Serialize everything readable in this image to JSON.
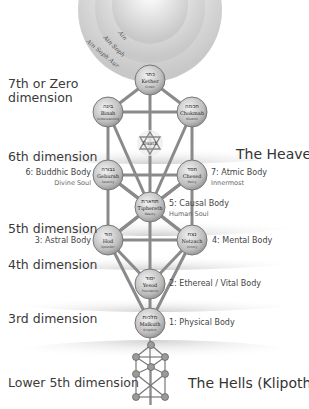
{
  "diagram": {
    "type": "tree-of-life",
    "ain_rings": [
      "Ain",
      "Ain Soph",
      "Ain Soph Aur"
    ],
    "dimensions": [
      {
        "label_line1": "7th or Zero",
        "label_line2": "dimension",
        "y": 126
      },
      {
        "label_line1": "6th dimension",
        "y": 157
      },
      {
        "label_line1": "5th dimension",
        "y": 229
      },
      {
        "label_line1": "4th dimension",
        "y": 265
      },
      {
        "label_line1": "3rd dimension",
        "y": 319
      },
      {
        "label_line1": "Lower 5th dimension",
        "y": 383
      }
    ],
    "regions": {
      "heavens": "The Heavens",
      "hells": "The Hells (Klipoth)"
    },
    "sephiroth": [
      {
        "id": "kether",
        "name": "Kether",
        "hebrew": "כתר",
        "sub": "Crown",
        "x": 150,
        "y": 80
      },
      {
        "id": "binah",
        "name": "Binah",
        "hebrew": "בינה",
        "sub": "Understanding",
        "x": 108,
        "y": 112
      },
      {
        "id": "chokmah",
        "name": "Chokmah",
        "hebrew": "חכמה",
        "sub": "Wisdom",
        "x": 192,
        "y": 112
      },
      {
        "id": "daath",
        "name": "Daath",
        "hebrew": "",
        "sub": "",
        "x": 150,
        "y": 143
      },
      {
        "id": "geburah",
        "name": "Geburah",
        "hebrew": "גבורה",
        "sub": "Severity",
        "x": 108,
        "y": 175
      },
      {
        "id": "chesed",
        "name": "Chesed",
        "hebrew": "חסד",
        "sub": "Mercy",
        "x": 192,
        "y": 175
      },
      {
        "id": "tiphereth",
        "name": "Tiphereth",
        "hebrew": "תפארת",
        "sub": "Beauty",
        "x": 150,
        "y": 207
      },
      {
        "id": "hod",
        "name": "Hod",
        "hebrew": "הוד",
        "sub": "Splendor",
        "x": 108,
        "y": 240
      },
      {
        "id": "netzach",
        "name": "Netzach",
        "hebrew": "נצח",
        "sub": "Victory",
        "x": 192,
        "y": 240
      },
      {
        "id": "yesod",
        "name": "Yesod",
        "hebrew": "יסוד",
        "sub": "Foundation",
        "x": 150,
        "y": 284
      },
      {
        "id": "malkuth",
        "name": "Malkuth",
        "hebrew": "מלכות",
        "sub": "Kingdom",
        "x": 150,
        "y": 323
      }
    ],
    "bodies": [
      {
        "label": "7: Atmic Body",
        "sub": "Innermost",
        "side": "right",
        "x": 211,
        "y": 169
      },
      {
        "label": "6: Buddhic Body",
        "sub": "Divine Soul",
        "side": "left",
        "x": 88,
        "y": 169
      },
      {
        "label": "5: Causal Body",
        "sub": "Human Soul",
        "side": "right",
        "x": 170,
        "y": 201
      },
      {
        "label": "4: Mental Body",
        "sub": "",
        "side": "right",
        "x": 211,
        "y": 236
      },
      {
        "label": "3: Astral Body",
        "sub": "",
        "side": "left",
        "x": 88,
        "y": 236
      },
      {
        "label": "2: Ethereal / Vital Body",
        "sub": "",
        "side": "right",
        "x": 170,
        "y": 280
      },
      {
        "label": "1: Physical Body",
        "sub": "",
        "side": "right",
        "x": 170,
        "y": 319
      }
    ],
    "colors": {
      "path": "#8a8a8a",
      "node_fill": "#cfcfcf",
      "node_stroke": "#777777",
      "band": "#d9d9d9",
      "text": "#3a3a3a"
    }
  }
}
